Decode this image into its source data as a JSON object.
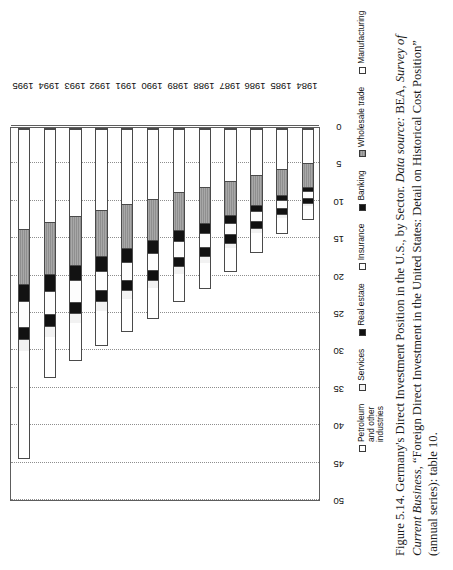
{
  "figure": {
    "caption_line1": "Figure 5.14. Germany's Direct Investment Position in the U.S., by Sector. ",
    "caption_datasource_label": "Data source:",
    "caption_line2": " BEA, ",
    "caption_journal": "Survey of Current Business,",
    "caption_line3": " “Foreign Direct Investment in the United States: Detail on Historical Cost Position” (annual series): table 10."
  },
  "axes": {
    "value_axis_title": "billions of dollars (historical cost)",
    "value_ticks": [
      0,
      5,
      10,
      15,
      20,
      25,
      30,
      35,
      40,
      45,
      50
    ],
    "value_min": 0,
    "value_max": 50,
    "category_axis_title": ""
  },
  "legend": {
    "position": "below-plot",
    "items": [
      {
        "label": "Petroleum and other industries",
        "key": "petroleum",
        "swatch": "open-white"
      },
      {
        "label": "Services",
        "key": "services",
        "swatch": "light-gray"
      },
      {
        "label": "Real estate",
        "key": "realestate",
        "swatch": "solid-black"
      },
      {
        "label": "Insurance",
        "key": "insurance",
        "swatch": "open-white"
      },
      {
        "label": "Banking",
        "key": "banking",
        "swatch": "solid-black"
      },
      {
        "label": "Wholesale trade",
        "key": "wholesale",
        "swatch": "hatched-gray"
      },
      {
        "label": "Manufacturing",
        "key": "manufacturing",
        "swatch": "open-white"
      }
    ]
  },
  "chart_data": {
    "type": "bar",
    "orientation": "horizontal-stacked",
    "title": "Germany's Direct Investment Position in the U.S., by Sector",
    "xlabel": "",
    "ylabel": "billions of dollars (historical cost)",
    "ylim": [
      0,
      50
    ],
    "grid": true,
    "categories": [
      "1984",
      "1985",
      "1986",
      "1987",
      "1988",
      "1989",
      "1990",
      "1991",
      "1992",
      "1993",
      "1994",
      "1995"
    ],
    "series": [
      {
        "name": "Manufacturing",
        "values": [
          4.6,
          5.4,
          6.2,
          7.1,
          7.8,
          8.5,
          9.4,
          10.1,
          10.9,
          11.8,
          12.6,
          13.4
        ]
      },
      {
        "name": "Wholesale trade",
        "values": [
          3.3,
          3.6,
          4.1,
          4.5,
          4.9,
          5.2,
          5.6,
          6.0,
          6.3,
          6.6,
          7.0,
          7.4
        ]
      },
      {
        "name": "Banking",
        "values": [
          0.6,
          0.7,
          0.9,
          1.1,
          1.4,
          1.5,
          1.7,
          1.8,
          1.9,
          2.0,
          2.2,
          2.3
        ]
      },
      {
        "name": "Insurance",
        "values": [
          0.9,
          1.1,
          1.3,
          1.6,
          1.9,
          2.1,
          2.3,
          2.5,
          2.6,
          2.9,
          3.2,
          3.5
        ]
      },
      {
        "name": "Real estate",
        "values": [
          0.7,
          0.8,
          1.0,
          1.1,
          1.2,
          1.3,
          1.4,
          1.4,
          1.5,
          1.5,
          1.6,
          1.7
        ]
      },
      {
        "name": "Services",
        "values": [
          0.4,
          0.5,
          0.6,
          0.8,
          0.9,
          1.0,
          1.1,
          1.2,
          1.3,
          1.4,
          1.5,
          1.6
        ]
      },
      {
        "name": "Petroleum and other industries",
        "values": [
          1.8,
          2.1,
          2.6,
          3.1,
          3.4,
          3.7,
          4.0,
          4.3,
          4.6,
          5.0,
          5.3,
          14.3
        ]
      }
    ],
    "totals": [
      12.3,
      14.2,
      16.7,
      19.3,
      21.5,
      23.3,
      25.5,
      27.3,
      29.1,
      31.2,
      33.4,
      44.2
    ]
  }
}
